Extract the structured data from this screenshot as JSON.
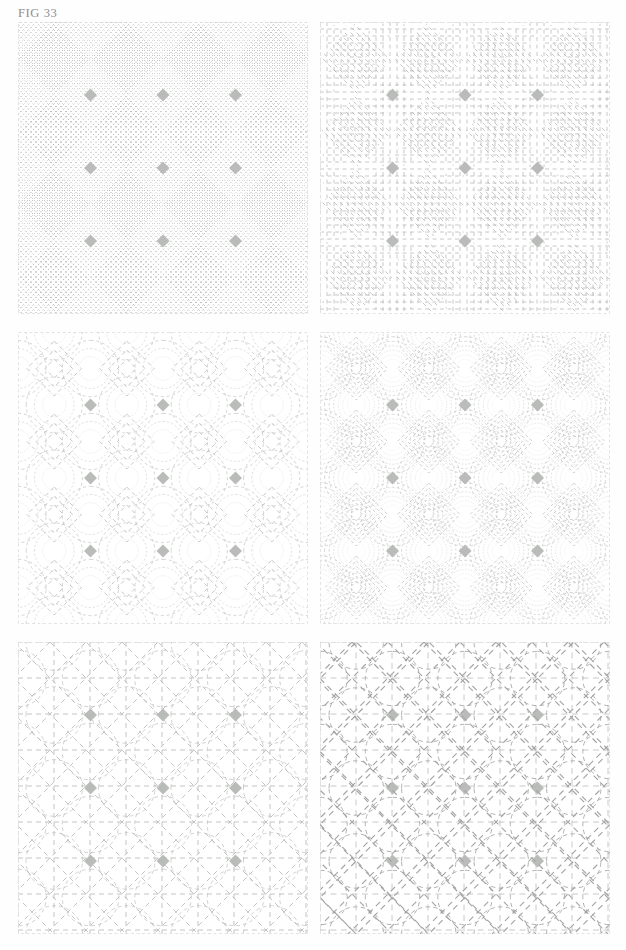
{
  "figure": {
    "label": "FIG 33",
    "page_background": "#fefefe"
  },
  "palette": {
    "background_fill": "#ffffff",
    "patch_grey": "#d9dcd9",
    "node_grey": "#b9bcb9",
    "stitch_line": "#b7bab7",
    "stitch_line_dark": "#a2a5a2",
    "border_line": "#dfe1df",
    "label_text": "#8d8f8d"
  },
  "block": {
    "name": "orange-peel-cathedral-window",
    "grid_divisions": 4,
    "cell_size_px": 72.5,
    "circle_radius_ratio": 0.5,
    "description": "Overlapping circles on a 4x4 grid forming pointed oval petals, with grey background triangles and small darker diamond nodes at circle intersections."
  },
  "panels": [
    {
      "index": 1,
      "position": "top-left",
      "fill_name": "dense-diagonal-crosshatch",
      "fill_label": "Dense diagonal cross-hatch",
      "stitch": {
        "style": "crosshatch",
        "spacing_px": 5,
        "angle_deg": 45,
        "dash": "1.4 2.2",
        "weight": 0.7,
        "color": "#b7bab7"
      },
      "center_motif": "dense-crosshatched-diamond"
    },
    {
      "index": 2,
      "position": "top-right",
      "fill_name": "parallel-dashed-lines",
      "fill_label": "Parallel dashed channel lines",
      "stitch": {
        "style": "parallel",
        "spacing_px": 7,
        "angle_deg": 0,
        "dash": "4 3.5",
        "weight": 0.8,
        "color": "#b7bab7"
      },
      "center_motif": "chevron-dashed-diamond"
    },
    {
      "index": 3,
      "position": "middle-left",
      "fill_name": "echo-outline-open",
      "fill_label": "Echo outline quilting, wide spacing",
      "stitch": {
        "style": "echo",
        "spacing_px": 9,
        "rings": 3,
        "dash": "4 3.5",
        "weight": 0.8,
        "color": "#b7bab7"
      },
      "center_motif": "nested-diamonds"
    },
    {
      "index": 4,
      "position": "middle-right",
      "fill_name": "echo-outline-dense",
      "fill_label": "Echo outline quilting, close spacing",
      "stitch": {
        "style": "echo",
        "spacing_px": 5,
        "rings": 6,
        "dash": "3 2.8",
        "weight": 0.7,
        "color": "#b7bab7"
      },
      "center_motif": "nested-diamonds-dense"
    },
    {
      "index": 5,
      "position": "bottom-left",
      "fill_name": "grid-and-diagonal-overlay",
      "fill_label": "Straight grid with diagonal cross lines",
      "stitch": {
        "style": "grid-diagonal",
        "spacing_px": 36,
        "dash": "5 4",
        "weight": 0.85,
        "color": "#b7bab7"
      },
      "center_motif": "radiating-diagonals"
    },
    {
      "index": 6,
      "position": "bottom-right",
      "fill_name": "bold-diagonal-and-square-overlay",
      "fill_label": "Bold dashed diagonals with on-point squares",
      "stitch": {
        "style": "diagonal-squares",
        "spacing_px": 36,
        "dash": "6 4.5",
        "weight": 1.15,
        "color": "#a2a5a2"
      },
      "center_motif": "radiating-star"
    }
  ]
}
